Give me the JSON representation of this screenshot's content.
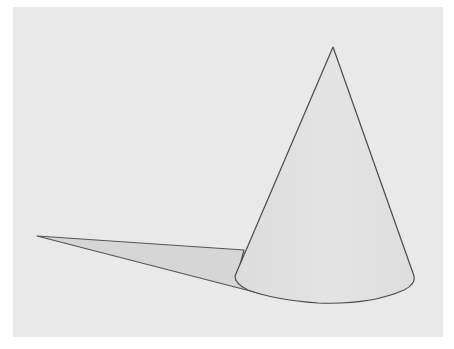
{
  "figure": {
    "colors": {
      "page": "#ffffff",
      "background": "#e9e9e9",
      "cone_fill": "#e2e2e2",
      "shadow_fill": "#d6d6d6",
      "outline": "#555555"
    },
    "geometry": {
      "apex": [
        333,
        47
      ],
      "base_left": [
        235,
        277
      ],
      "base_right": [
        415,
        280
      ],
      "base_bottom": [
        320,
        304
      ],
      "shadow_tip": [
        37,
        236
      ],
      "shadow_join": [
        244,
        250
      ]
    }
  }
}
